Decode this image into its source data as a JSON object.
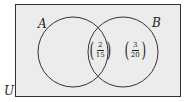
{
  "diagram": {
    "type": "venn",
    "universe_label": "U",
    "sets": [
      {
        "label": "A"
      },
      {
        "label": "B"
      }
    ],
    "regions": {
      "a_and_b": {
        "numerator": "2",
        "denominator": "15"
      },
      "b_only": {
        "numerator": "3",
        "denominator": "20"
      }
    },
    "colors": {
      "background": "#ececec",
      "stroke": "#333333"
    }
  }
}
